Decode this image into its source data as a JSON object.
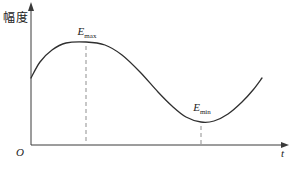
{
  "figure": {
    "ylabel": "幅度",
    "xlabel": "t",
    "origin": "O",
    "annotations": {
      "max": {
        "base": "E",
        "sub": "max"
      },
      "min": {
        "base": "E",
        "sub": "min"
      }
    },
    "colors": {
      "curve": "#2f2f2f",
      "axis": "#3a3a3a",
      "dash": "#8f8f8f",
      "background": "#ffffff"
    }
  },
  "chart_data": {
    "type": "line",
    "title": "",
    "xlabel": "t",
    "ylabel": "幅度",
    "axes_numeric": false,
    "series": [
      {
        "name": "amplitude-envelope",
        "t_normalized": [
          0,
          0.04,
          0.09,
          0.15,
          0.24,
          0.32,
          0.39,
          0.47,
          0.55,
          0.61,
          0.67,
          0.74,
          0.79,
          0.85,
          0.91,
          0.96,
          1.0
        ],
        "values_normalized": [
          0.65,
          0.81,
          0.92,
          0.99,
          1.0,
          0.97,
          0.87,
          0.71,
          0.52,
          0.38,
          0.27,
          0.22,
          0.23,
          0.3,
          0.42,
          0.53,
          0.65
        ]
      }
    ],
    "extrema": {
      "max": {
        "label": "E_max",
        "t_normalized": 0.24,
        "value_normalized": 1.0
      },
      "min": {
        "label": "E_min",
        "t_normalized": 0.74,
        "value_normalized": 0.22
      }
    },
    "points_px": [
      [
        31,
        78
      ],
      [
        40,
        62
      ],
      [
        52,
        50
      ],
      [
        66,
        43
      ],
      [
        86,
        42
      ],
      [
        105,
        45
      ],
      [
        122,
        55
      ],
      [
        140,
        72
      ],
      [
        158,
        92
      ],
      [
        172,
        106
      ],
      [
        186,
        117
      ],
      [
        201,
        122
      ],
      [
        214,
        121
      ],
      [
        228,
        114
      ],
      [
        242,
        102
      ],
      [
        253,
        90
      ],
      [
        262,
        78
      ]
    ],
    "markers_px": [
      {
        "name": "max-dash",
        "x": 86,
        "y1": 46,
        "y2": 144
      },
      {
        "name": "min-dash",
        "x": 201,
        "y1": 126,
        "y2": 144
      }
    ],
    "legend": false,
    "grid": false
  }
}
